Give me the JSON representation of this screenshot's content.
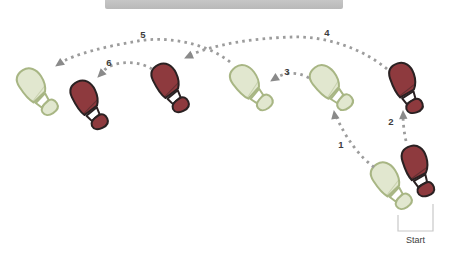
{
  "diagram": {
    "start_label": "Start",
    "colors": {
      "top_bar": "#b9b9b9",
      "background": "#ffffff",
      "green_fill": "#e1e7cf",
      "green_stroke": "#a8b684",
      "red_fill": "#8e3a3e",
      "red_stroke": "#2a2122",
      "arch_fill": "#ffffff",
      "dots": "#9c9c9c",
      "arrowhead": "#8a8a8a",
      "step_number": "#3d3d3d",
      "bracket": "#c8c8c8",
      "start_text": "#3c3c3c"
    },
    "footprints": [
      {
        "name": "left-foot-final-position",
        "color": "green",
        "x": 37,
        "y": 92,
        "rotation": -33
      },
      {
        "name": "right-foot-final-position",
        "color": "red",
        "x": 89,
        "y": 105,
        "rotation": -26
      },
      {
        "name": "right-foot-position-4",
        "color": "red",
        "x": 170,
        "y": 88,
        "rotation": -26
      },
      {
        "name": "left-foot-position-3",
        "color": "green",
        "x": 251,
        "y": 88,
        "rotation": -37
      },
      {
        "name": "left-foot-position-1",
        "color": "green",
        "x": 331,
        "y": 88,
        "rotation": -38
      },
      {
        "name": "right-foot-position-2",
        "color": "red",
        "x": 406,
        "y": 88,
        "rotation": -19
      },
      {
        "name": "left-foot-start",
        "color": "green",
        "x": 391,
        "y": 186,
        "rotation": -33
      },
      {
        "name": "right-foot-start",
        "color": "red",
        "x": 418,
        "y": 171,
        "rotation": -17
      }
    ],
    "steps": [
      {
        "label": "1",
        "path": "M 374,167 C 360,157 346,139 335,114",
        "head": {
          "x": 334,
          "y": 111,
          "angle": -100
        },
        "label_x": 341,
        "label_y": 148
      },
      {
        "label": "2",
        "path": "M 406,141 C 404,132 403,123 403,114",
        "head": {
          "x": 403,
          "y": 111,
          "angle": -92
        },
        "label_x": 391,
        "label_y": 125
      },
      {
        "label": "3",
        "path": "M 309,78 C 297,71 283,72 273,80",
        "head": {
          "x": 271,
          "y": 81,
          "angle": 147
        },
        "label_x": 287,
        "label_y": 75
      },
      {
        "label": "4",
        "path": "M 387,69 C 362,48 325,36 293,37 C 255,38 214,44 188,56",
        "head": {
          "x": 185,
          "y": 58,
          "angle": 155
        },
        "label_x": 327,
        "label_y": 36
      },
      {
        "label": "5",
        "path": "M 230,62 C 205,42 165,36 138,41 C 108,46 73,54 59,64",
        "head": {
          "x": 56,
          "y": 66,
          "angle": 145
        },
        "label_x": 143,
        "label_y": 38
      },
      {
        "label": "6",
        "path": "M 152,69 C 141,62 125,61 113,65 C 107,67 103,71 100,75",
        "head": {
          "x": 98,
          "y": 77,
          "angle": 135
        },
        "label_x": 109,
        "label_y": 66
      }
    ],
    "start_bracket": {
      "points": "398,215 398,231 433,231 433,204",
      "label_x": 415.5,
      "label_y": 243
    }
  }
}
